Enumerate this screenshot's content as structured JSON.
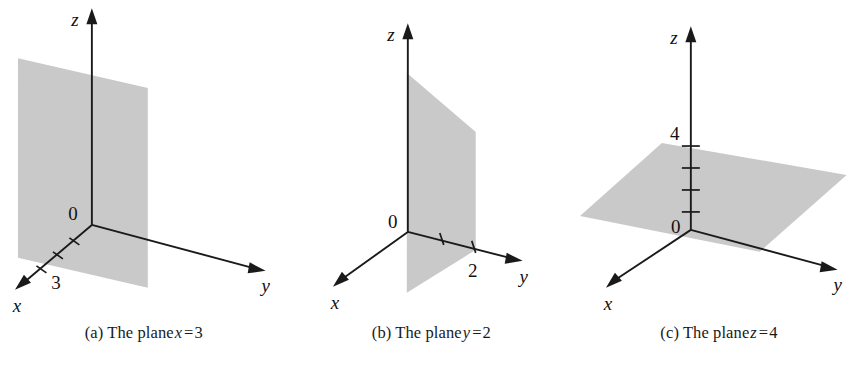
{
  "figure": {
    "background_color": "#ffffff",
    "plane_fill_color": "#c9c9c9",
    "axis_color": "#1a1a1a",
    "text_color": "#111111"
  },
  "panels": [
    {
      "id": "panel-a",
      "caption_prefix": "(a) The plane",
      "caption_variable": "x",
      "caption_equals": "=",
      "caption_value": "3",
      "caption_full": "(a) The plane x = 3",
      "axes": {
        "x_label": "x",
        "y_label": "y",
        "z_label": "z"
      },
      "origin_label": "0",
      "tick_label": "3",
      "tick_axis": "x",
      "tick_count": 3,
      "plane_orientation": "vertical-parallel-to-yz",
      "plane_equation": "x = 3"
    },
    {
      "id": "panel-b",
      "caption_prefix": "(b) The plane",
      "caption_variable": "y",
      "caption_equals": "=",
      "caption_value": "2",
      "caption_full": "(b) The plane y = 2",
      "axes": {
        "x_label": "x",
        "y_label": "y",
        "z_label": "z"
      },
      "origin_label": "0",
      "tick_label": "2",
      "tick_axis": "y",
      "tick_count": 2,
      "plane_orientation": "vertical-parallel-to-xz",
      "plane_equation": "y = 2"
    },
    {
      "id": "panel-c",
      "caption_prefix": "(c) The plane",
      "caption_variable": "z",
      "caption_equals": "=",
      "caption_value": "4",
      "caption_full": "(c) The plane z = 4",
      "axes": {
        "x_label": "x",
        "y_label": "y",
        "z_label": "z"
      },
      "origin_label": "0",
      "tick_label": "4",
      "tick_axis": "z",
      "tick_count": 4,
      "plane_orientation": "horizontal-parallel-to-xy",
      "plane_equation": "z = 4"
    }
  ]
}
